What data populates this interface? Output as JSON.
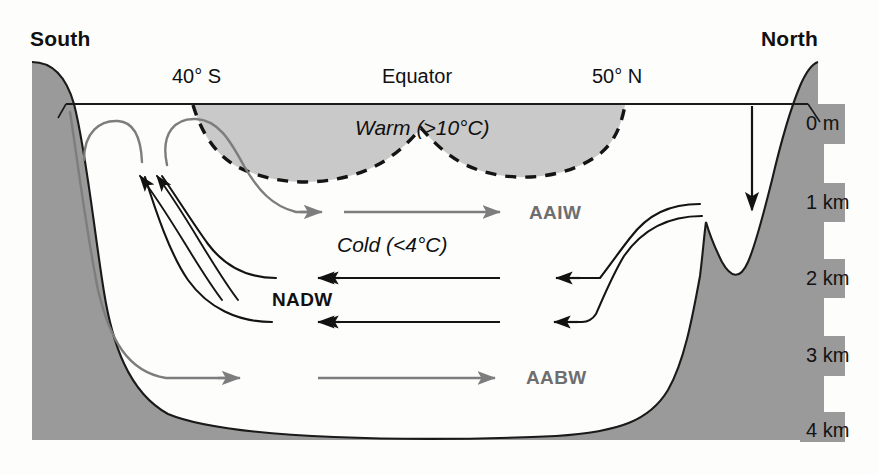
{
  "figure": {
    "type": "diagram"
  },
  "compass": {
    "south": "South",
    "north": "North"
  },
  "latitudes": [
    {
      "name": "lat-40s",
      "label": "40° S",
      "x": 172,
      "y": 66
    },
    {
      "name": "lat-equator",
      "label": "Equator",
      "x": 382,
      "y": 66
    },
    {
      "name": "lat-50n",
      "label": "50° N",
      "x": 592,
      "y": 66
    }
  ],
  "water_layers": [
    {
      "name": "warm-layer-label",
      "label": "Warm (>10°C)",
      "x": 355,
      "y": 117
    },
    {
      "name": "cold-layer-label",
      "label": "Cold (<4°C)",
      "x": 337,
      "y": 234
    }
  ],
  "water_masses": [
    {
      "name": "aaiw-label",
      "label": "AAIW",
      "color": "#6e6e6e",
      "x": 529,
      "y": 203
    },
    {
      "name": "nadw-label",
      "label": "NADW",
      "color": "#111111",
      "x": 272,
      "y": 290
    },
    {
      "name": "aabw-label",
      "label": "AABW",
      "color": "#6e6e6e",
      "x": 526,
      "y": 368
    }
  ],
  "depth_scale": [
    {
      "name": "depth-0m",
      "label": "0 m",
      "y": 113
    },
    {
      "name": "depth-1km",
      "label": "1 km",
      "y": 192
    },
    {
      "name": "depth-2km",
      "label": "2 km",
      "y": 268
    },
    {
      "name": "depth-3km",
      "label": "3 km",
      "y": 345
    },
    {
      "name": "depth-4km",
      "label": "4 km",
      "y": 420
    }
  ],
  "colors": {
    "land": "#9a9a9a",
    "warm_fill": "#c9c9c9",
    "outline": "#1a1a1a",
    "gray_flow": "#7d7d7d",
    "black_flow": "#121212",
    "background": "#fdfdfc"
  },
  "flows": {
    "gray_arrows": [
      "AAIW northward",
      "AABW northward"
    ],
    "black_arrows": [
      "NADW southward upper",
      "NADW southward lower",
      "upwelling south 1",
      "upwelling south 2",
      "north sinking"
    ]
  }
}
